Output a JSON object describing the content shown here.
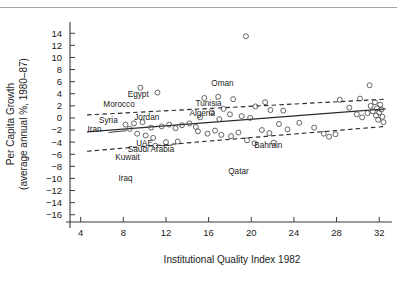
{
  "chart_data": {
    "type": "scatter",
    "title": "",
    "xlabel": "Institutional Quality Index 1982",
    "ylabel": "Per Capita Growth (average annual %, 1980–87)",
    "ylabel_line1": "Per Capita Growth",
    "ylabel_line2": "(average annual %, 1980–87)",
    "xlim": [
      3.0,
      33.2
    ],
    "ylim": [
      -17.2,
      15.2
    ],
    "xticks": [
      4,
      8,
      12,
      16,
      20,
      24,
      28,
      32
    ],
    "yticks": [
      14,
      12,
      10,
      8,
      6,
      4,
      2,
      0,
      -2,
      -4,
      -6,
      -8,
      -10,
      -12,
      -14,
      -16
    ],
    "xticklabels": [
      "4",
      "8",
      "12",
      "16",
      "20",
      "24",
      "28",
      "32"
    ],
    "yticklabels": [
      "14",
      "12",
      "10",
      "8",
      "6",
      "4",
      "2",
      "0",
      "-2",
      "-4",
      "-6",
      "-8",
      "-10",
      "-12",
      "-14",
      "-16"
    ],
    "grid": false,
    "legend": null,
    "marker_style": "open-circle",
    "points": [
      [
        9.6,
        5.0
      ],
      [
        11.2,
        4.2
      ],
      [
        19.5,
        13.5
      ],
      [
        15.6,
        3.3
      ],
      [
        16.9,
        3.5
      ],
      [
        18.3,
        3.1
      ],
      [
        20.4,
        1.9
      ],
      [
        21.3,
        2.6
      ],
      [
        21.8,
        1.3
      ],
      [
        17.4,
        1.5
      ],
      [
        18.0,
        0.6
      ],
      [
        19.1,
        0.3
      ],
      [
        16.3,
        0.9
      ],
      [
        17.0,
        -0.2
      ],
      [
        15.2,
        0.1
      ],
      [
        9.0,
        -0.9
      ],
      [
        9.8,
        -0.7
      ],
      [
        10.6,
        -1.6
      ],
      [
        8.6,
        -1.8
      ],
      [
        9.3,
        -2.6
      ],
      [
        10.1,
        -2.9
      ],
      [
        10.8,
        -3.3
      ],
      [
        11.6,
        -1.4
      ],
      [
        12.3,
        -1.1
      ],
      [
        12.9,
        -1.7
      ],
      [
        13.5,
        -1.2
      ],
      [
        14.2,
        -0.9
      ],
      [
        14.8,
        -1.5
      ],
      [
        15.0,
        -2.2
      ],
      [
        15.9,
        -2.6
      ],
      [
        16.6,
        -2.1
      ],
      [
        17.2,
        -2.8
      ],
      [
        18.1,
        -3.0
      ],
      [
        18.8,
        -2.4
      ],
      [
        19.6,
        -3.7
      ],
      [
        20.3,
        -4.2
      ],
      [
        21.0,
        -2.0
      ],
      [
        21.7,
        -2.5
      ],
      [
        22.6,
        -1.0
      ],
      [
        23.4,
        -1.9
      ],
      [
        24.5,
        -0.8
      ],
      [
        25.9,
        -1.6
      ],
      [
        26.8,
        -2.6
      ],
      [
        27.3,
        -3.1
      ],
      [
        27.9,
        -2.7
      ],
      [
        29.2,
        1.7
      ],
      [
        29.9,
        0.6
      ],
      [
        30.4,
        0.1
      ],
      [
        30.9,
        0.8
      ],
      [
        31.2,
        2.0
      ],
      [
        31.4,
        1.1
      ],
      [
        31.6,
        2.6
      ],
      [
        31.7,
        0.4
      ],
      [
        31.8,
        1.6
      ],
      [
        31.9,
        -0.3
      ],
      [
        32.0,
        0.9
      ],
      [
        32.1,
        2.2
      ],
      [
        32.2,
        1.4
      ],
      [
        32.3,
        0.2
      ],
      [
        32.4,
        -0.7
      ],
      [
        31.1,
        5.4
      ],
      [
        28.3,
        3.0
      ],
      [
        23.0,
        1.2
      ],
      [
        12.0,
        -4.0
      ],
      [
        13.1,
        -3.9
      ],
      [
        22.1,
        -4.1
      ],
      [
        11.0,
        -4.6
      ],
      [
        8.2,
        -1.1
      ],
      [
        19.9,
        0.0
      ],
      [
        30.2,
        3.2
      ]
    ],
    "fit_line": {
      "x": [
        4.6,
        32.6
      ],
      "y": [
        -2.3,
        1.5
      ],
      "style": "solid"
    },
    "ci_upper": {
      "x": [
        4.6,
        32.6
      ],
      "y": [
        0.5,
        3.1
      ],
      "style": "dashed"
    },
    "ci_lower": {
      "x": [
        4.6,
        32.6
      ],
      "y": [
        -5.5,
        -1.4
      ],
      "style": "dashed"
    },
    "annotations": [
      {
        "text": "Egypt",
        "x": 9.4,
        "y": 3.5,
        "anchor": "middle"
      },
      {
        "text": "Oman",
        "x": 17.3,
        "y": 5.2,
        "anchor": "middle"
      },
      {
        "text": "Morocco",
        "x": 7.6,
        "y": 1.8,
        "anchor": "middle"
      },
      {
        "text": "Tunisia",
        "x": 16.0,
        "y": 1.9,
        "anchor": "middle"
      },
      {
        "text": "Algeria",
        "x": 15.4,
        "y": 0.4,
        "anchor": "middle"
      },
      {
        "text": "Syria",
        "x": 6.6,
        "y": -0.9,
        "anchor": "middle"
      },
      {
        "text": "Jordan",
        "x": 10.2,
        "y": -0.3,
        "anchor": "middle"
      },
      {
        "text": "Iran",
        "x": 5.3,
        "y": -2.4,
        "anchor": "middle"
      },
      {
        "text": "UAE",
        "x": 10.0,
        "y": -4.6,
        "anchor": "middle"
      },
      {
        "text": "Bahrain",
        "x": 21.6,
        "y": -5.0,
        "anchor": "middle"
      },
      {
        "text": "Saudi Arabia",
        "x": 10.6,
        "y": -5.7,
        "anchor": "middle"
      },
      {
        "text": "Kuwait",
        "x": 8.4,
        "y": -7.0,
        "anchor": "middle"
      },
      {
        "text": "Qatar",
        "x": 18.8,
        "y": -9.3,
        "anchor": "middle"
      },
      {
        "text": "Iraq",
        "x": 8.2,
        "y": -10.5,
        "anchor": "middle"
      }
    ],
    "leader_lines": [
      {
        "x1": 6.6,
        "y1": -2.4,
        "x2": 8.3,
        "y2": -2.1
      },
      {
        "x1": 11.4,
        "y1": -4.6,
        "x2": 12.6,
        "y2": -4.5
      }
    ]
  }
}
